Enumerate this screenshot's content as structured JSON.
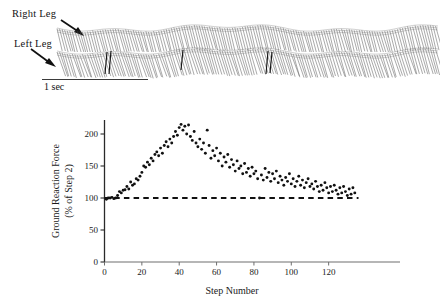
{
  "figure": {
    "gait": {
      "right_leg_label": "Right Leg",
      "left_leg_label": "Left Leg",
      "scalebar_label": "1 sec"
    }
  },
  "chart_data": {
    "type": "scatter",
    "title": "",
    "xlabel": "Step Number",
    "ylabel": "Ground Reaction Force\n(% of Step 2)",
    "ylabel_line1": "Ground Reaction Force",
    "ylabel_line2": "(% of Step 2)",
    "xlim": [
      0,
      140
    ],
    "ylim": [
      0,
      225
    ],
    "xticks": [
      0,
      20,
      40,
      60,
      80,
      100,
      120
    ],
    "yticks": [
      0,
      50,
      100,
      150,
      200
    ],
    "grid": false,
    "legend": "none",
    "marker": "filled-circle",
    "marker_color": "#111111",
    "reference_line": {
      "type": "horizontal-dashed",
      "y": 100,
      "x_start": 0,
      "x_end": 136,
      "color": "#111111",
      "label": ""
    },
    "x": [
      1,
      2,
      3,
      4,
      5,
      6,
      7,
      8,
      9,
      10,
      11,
      12,
      13,
      14,
      15,
      16,
      17,
      18,
      19,
      20,
      21,
      22,
      23,
      24,
      25,
      26,
      27,
      28,
      29,
      30,
      31,
      32,
      33,
      34,
      35,
      36,
      37,
      38,
      39,
      40,
      41,
      42,
      43,
      44,
      45,
      46,
      47,
      48,
      49,
      50,
      51,
      52,
      53,
      54,
      55,
      56,
      57,
      58,
      59,
      60,
      61,
      62,
      63,
      64,
      65,
      66,
      67,
      68,
      69,
      70,
      71,
      72,
      73,
      74,
      75,
      76,
      77,
      78,
      79,
      80,
      81,
      82,
      83,
      84,
      85,
      86,
      87,
      88,
      89,
      90,
      91,
      92,
      93,
      94,
      95,
      96,
      97,
      98,
      99,
      100,
      101,
      102,
      103,
      104,
      105,
      106,
      107,
      108,
      109,
      110,
      111,
      112,
      113,
      114,
      115,
      116,
      117,
      118,
      119,
      120,
      121,
      122,
      123,
      124,
      125,
      126,
      127,
      128,
      129,
      130,
      131,
      132,
      133,
      134
    ],
    "y": [
      98,
      100,
      100,
      101,
      99,
      100,
      104,
      110,
      108,
      112,
      113,
      118,
      114,
      125,
      120,
      122,
      130,
      128,
      134,
      140,
      150,
      148,
      156,
      152,
      162,
      158,
      168,
      172,
      166,
      178,
      170,
      182,
      188,
      180,
      192,
      186,
      196,
      204,
      198,
      210,
      215,
      206,
      212,
      200,
      214,
      196,
      190,
      204,
      186,
      180,
      192,
      176,
      186,
      170,
      206,
      182,
      162,
      174,
      166,
      178,
      158,
      170,
      150,
      164,
      156,
      168,
      148,
      160,
      152,
      142,
      158,
      146,
      150,
      138,
      154,
      140,
      146,
      134,
      148,
      138,
      142,
      130,
      100,
      136,
      128,
      146,
      132,
      140,
      126,
      138,
      130,
      142,
      124,
      134,
      128,
      120,
      132,
      126,
      138,
      122,
      130,
      118,
      126,
      134,
      120,
      128,
      116,
      124,
      130,
      118,
      122,
      114,
      126,
      118,
      110,
      120,
      112,
      124,
      116,
      108,
      118,
      110,
      120,
      112,
      106,
      116,
      108,
      118,
      110,
      104,
      114,
      106,
      116,
      108
    ],
    "series_note": "Ground reaction force per step as percent of step 2",
    "y_axis_label_rotated": true
  }
}
